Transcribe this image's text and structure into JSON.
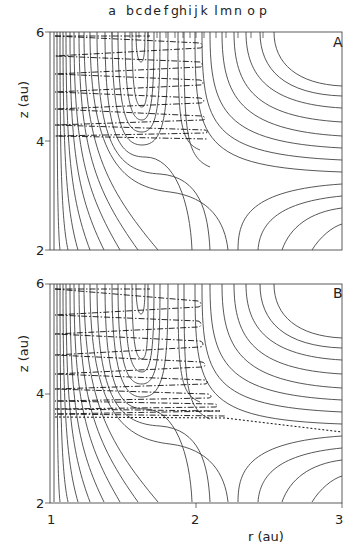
{
  "chart_data": [
    {
      "type": "contour",
      "panel": "A",
      "title": "",
      "xlabel": "",
      "ylabel": "z (au)",
      "xlim": [
        1,
        3
      ],
      "ylim": [
        2,
        6
      ],
      "yticks": [
        "2",
        "4",
        "6"
      ],
      "annotation": "A",
      "top_markers": [
        "a",
        "b",
        "c",
        "d",
        "e",
        "f",
        "g",
        "h",
        "i",
        "j",
        "k",
        "l",
        "m",
        "n",
        "o",
        "p"
      ],
      "description": "Potential energy surface contours with saddle point near r≈1.9 au, z≈3.3 au; dash-dot trajectory oscillating between r≈1.05 and r≈2.0 for z from 6 down to ~4.1"
    },
    {
      "type": "contour",
      "panel": "B",
      "title": "",
      "xlabel": "r (au)",
      "ylabel": "z (au)",
      "xlim": [
        1,
        3
      ],
      "ylim": [
        2,
        6
      ],
      "xticks": [
        "1",
        "2",
        "3"
      ],
      "yticks": [
        "2",
        "4",
        "6"
      ],
      "annotation": "B",
      "description": "Same contours; dash-dot trajectory oscillates down to z≈3.8 then exits toward r=3 at z≈3.35 (dotted dissociation path)"
    }
  ],
  "header": {
    "markers": [
      {
        "label": "a",
        "x": 112
      },
      {
        "label": "b",
        "x": 130
      },
      {
        "label": "c",
        "x": 139
      },
      {
        "label": "d",
        "x": 148
      },
      {
        "label": "e",
        "x": 157
      },
      {
        "label": "f",
        "x": 166
      },
      {
        "label": "g",
        "x": 175
      },
      {
        "label": "h",
        "x": 183
      },
      {
        "label": "i",
        "x": 190
      },
      {
        "label": "j",
        "x": 196
      },
      {
        "label": "k",
        "x": 204
      },
      {
        "label": "l",
        "x": 216
      },
      {
        "label": "m",
        "x": 226
      },
      {
        "label": "n",
        "x": 238
      },
      {
        "label": "o",
        "x": 251
      },
      {
        "label": "p",
        "x": 263
      }
    ]
  },
  "panelA": {
    "label": "A",
    "ytick_top": "6",
    "ytick_mid": "4",
    "ytick_bot": "2",
    "ylabel": "z (au)"
  },
  "panelB": {
    "label": "B",
    "ytick_top": "6",
    "ytick_mid": "4",
    "ytick_bot": "2",
    "ylabel": "z (au)",
    "xtick_left": "1",
    "xtick_mid": "2",
    "xtick_right": "3",
    "xlabel": "r (au)"
  }
}
